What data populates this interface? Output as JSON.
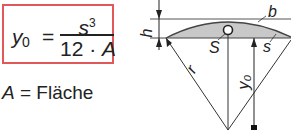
{
  "formula": {
    "lhs_var": "y",
    "lhs_sub": "0",
    "equals": "=",
    "numerator_var": "s",
    "numerator_exp": "3",
    "denominator_const": "12 · ",
    "denominator_var": "A",
    "border_color": "#e0585a"
  },
  "legend": {
    "var": "A",
    "text": " = Fläche"
  },
  "diagram": {
    "labels": {
      "h": "h",
      "b": "b",
      "S": "S",
      "s": "s",
      "r": "r",
      "y0": "y₀"
    },
    "segment_fill": "#c8c8c8"
  }
}
